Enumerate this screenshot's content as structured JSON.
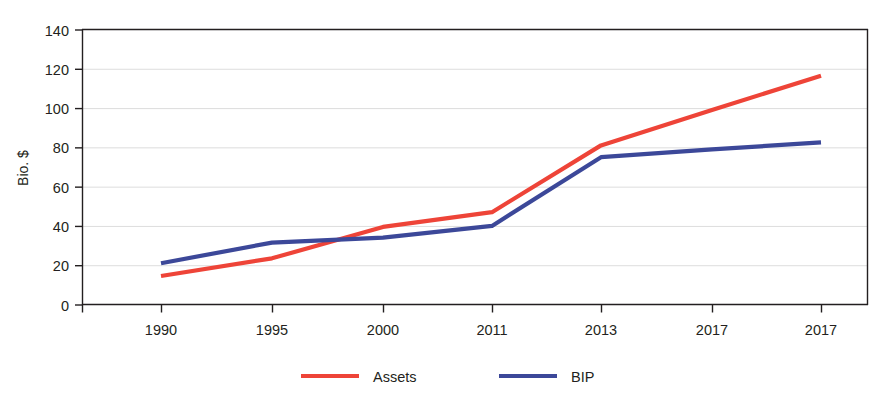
{
  "title_partial": "",
  "chart_data": {
    "type": "line",
    "title": "",
    "xlabel": "",
    "ylabel": "Bio. $",
    "categories": [
      "1990",
      "1995",
      "2000",
      "2011",
      "2013",
      "2017",
      "2017"
    ],
    "ylim": [
      0,
      140
    ],
    "yticks": [
      0,
      20,
      40,
      60,
      80,
      100,
      120,
      140
    ],
    "grid": true,
    "grid_axis": "y",
    "legend_position": "bottom",
    "series": [
      {
        "name": "Assets",
        "color": "#ee4438",
        "values": [
          14.5,
          23.5,
          39.5,
          47.0,
          81.0,
          99.0,
          116.5
        ]
      },
      {
        "name": "BIP",
        "color": "#3c4899",
        "values": [
          21.0,
          31.5,
          34.0,
          40.0,
          75.0,
          79.0,
          82.5
        ]
      }
    ]
  },
  "axes": {
    "y_tick_labels": [
      "140",
      "120",
      "100",
      "80",
      "60",
      "40",
      "20",
      "0"
    ],
    "y_axis_title": "Bio. $",
    "x_tick_labels": [
      "1990",
      "1995",
      "2000",
      "2011",
      "2013",
      "2017",
      "2017"
    ]
  },
  "legend": {
    "items": [
      {
        "label": "Assets",
        "color": "#ee4438"
      },
      {
        "label": "BIP",
        "color": "#3c4899"
      }
    ]
  },
  "colors": {
    "assets": "#ee4438",
    "bip": "#3c4899",
    "axis": "#231f20",
    "grid": "#d9d9d9",
    "background": "#ffffff"
  }
}
